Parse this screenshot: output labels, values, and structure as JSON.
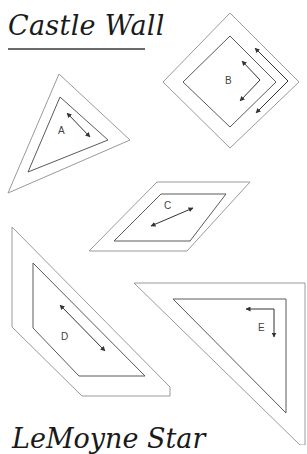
{
  "title": "Castle Wall",
  "footer_title": "LeMoyne Star",
  "pieces": [
    {
      "label": "A",
      "shape": "triangle",
      "grain_arrow": "double-headed diagonal"
    },
    {
      "label": "B",
      "shape": "square-diamond",
      "grain_arrow": "L-shaped along edges"
    },
    {
      "label": "C",
      "shape": "parallelogram",
      "grain_arrow": "double-headed diagonal"
    },
    {
      "label": "D",
      "shape": "trapezoid",
      "grain_arrow": "double-headed diagonal"
    },
    {
      "label": "E",
      "shape": "right-triangle",
      "grain_arrow": "L-shaped corner"
    }
  ],
  "colors": {
    "outer_line": "#9a9a9a",
    "inner_line": "#5a5a5a",
    "arrow": "#333333",
    "text": "#1a1a1a"
  }
}
